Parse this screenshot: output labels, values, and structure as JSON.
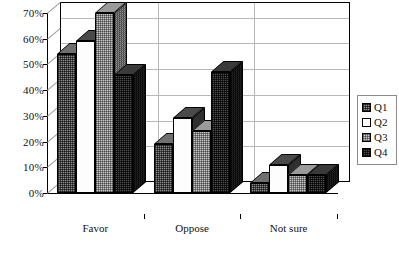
{
  "chart_data": {
    "type": "bar",
    "title": "",
    "subtitle": "",
    "xlabel": "",
    "ylabel": "",
    "categories": [
      "Favor",
      "Oppose",
      "Not sure"
    ],
    "series": [
      {
        "name": "Q1",
        "values": [
          54,
          19,
          4
        ]
      },
      {
        "name": "Q2",
        "values": [
          59,
          29,
          11
        ]
      },
      {
        "name": "Q3",
        "values": [
          70,
          24,
          7
        ]
      },
      {
        "name": "Q4",
        "values": [
          46,
          47,
          7
        ]
      }
    ],
    "ylim": [
      0,
      70
    ],
    "ytick_labels": [
      "0%",
      "10%",
      "20%",
      "30%",
      "40%",
      "50%",
      "60%",
      "70%"
    ],
    "ytick_values": [
      0,
      10,
      20,
      30,
      40,
      50,
      60,
      70
    ],
    "grid": true,
    "legend_position": "right",
    "three_d": true,
    "value_suffix": "%"
  },
  "legend": {
    "entries": [
      {
        "label": "Q1",
        "swatch": "q1"
      },
      {
        "label": "Q2",
        "swatch": "q2"
      },
      {
        "label": "Q3",
        "swatch": "q3"
      },
      {
        "label": "Q4",
        "swatch": "q4"
      }
    ]
  },
  "colors": {
    "q1": "#8a8a8a",
    "q2": "#ffffff",
    "q3": "#c8c8c8",
    "q4": "#4e4e4e",
    "axis": "#000000",
    "grid": "#b8b8b8",
    "text": "#111111"
  }
}
